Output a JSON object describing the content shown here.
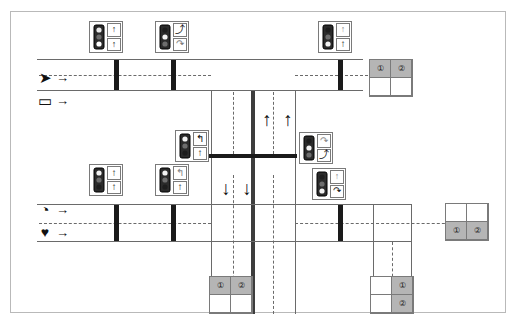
{
  "diagram": {
    "colors": {
      "road_line": "#6a6a6a",
      "stop_bar": "#1a1a1a",
      "median": "#3d3d3d",
      "phase_active_fill": "#b5b5b5",
      "frame_border": "#b9b9b9",
      "background": "#ffffff"
    }
  },
  "legend": {
    "items": [
      {
        "id": "legend-chevron",
        "glyph": "➤",
        "icon": "chevron-detector-icon",
        "arrow": "→"
      },
      {
        "id": "legend-rectangle",
        "glyph": "▭",
        "icon": "rectangle-detector-icon",
        "arrow": "→"
      },
      {
        "id": "legend-pie",
        "glyph": "◔",
        "icon": "pie-detector-icon",
        "arrow": "→"
      },
      {
        "id": "legend-heart",
        "glyph": "♥",
        "icon": "heart-detector-icon",
        "arrow": "→"
      }
    ]
  },
  "signals": [
    {
      "id": "signal-nw-outer",
      "faces": [
        "↑",
        "↑"
      ],
      "face_icons": [
        "through-ball-icon",
        "through-ball-icon"
      ]
    },
    {
      "id": "signal-nw-inner",
      "faces": [
        "⤴",
        "↷"
      ],
      "face_icons": [
        "right-turn-icon",
        "right-turn-curve-icon"
      ]
    },
    {
      "id": "signal-ne-top",
      "faces": [
        "↑",
        "↑"
      ],
      "face_icons": [
        "through-ball-icon",
        "through-arrow-icon"
      ]
    },
    {
      "id": "signal-mid-left",
      "faces": [
        "↰",
        "↑"
      ],
      "face_icons": [
        "left-turn-icon",
        "through-arrow-icon"
      ]
    },
    {
      "id": "signal-mid-right",
      "faces": [
        "↷",
        "⤴"
      ],
      "face_icons": [
        "right-turn-curve-icon",
        "right-turn-icon"
      ]
    },
    {
      "id": "signal-sw-outer",
      "faces": [
        "↑",
        "↑"
      ],
      "face_icons": [
        "through-arrow-icon",
        "through-arrow-icon"
      ]
    },
    {
      "id": "signal-sw-inner",
      "faces": [
        "↰",
        "↑"
      ],
      "face_icons": [
        "left-turn-curve-icon",
        "through-arrow-icon"
      ]
    },
    {
      "id": "signal-se-lower",
      "faces": [
        "↑",
        "↷"
      ],
      "face_icons": [
        "through-ball-icon",
        "right-turn-curve-icon"
      ]
    }
  ],
  "movement_arrows": [
    {
      "id": "arrow-nb-inner",
      "glyph": "↑",
      "direction": "north"
    },
    {
      "id": "arrow-nb-outer",
      "glyph": "↑",
      "direction": "north"
    },
    {
      "id": "arrow-sb-inner",
      "glyph": "↓",
      "direction": "south"
    },
    {
      "id": "arrow-sb-outer",
      "glyph": "↓",
      "direction": "south"
    }
  ],
  "phase_boxes": [
    {
      "id": "phase-box-east-top",
      "layout": "2x2",
      "cells": [
        {
          "label": "①",
          "active": true
        },
        {
          "label": "②",
          "active": true
        },
        {
          "label": "",
          "active": false
        },
        {
          "label": "",
          "active": false
        }
      ]
    },
    {
      "id": "phase-box-east-bottom",
      "layout": "2x2",
      "cells": [
        {
          "label": "",
          "active": false
        },
        {
          "label": "",
          "active": false
        },
        {
          "label": "①",
          "active": true
        },
        {
          "label": "②",
          "active": true
        }
      ]
    },
    {
      "id": "phase-box-south-center",
      "layout": "2x2",
      "cells": [
        {
          "label": "①",
          "active": true
        },
        {
          "label": "②",
          "active": true
        },
        {
          "label": "",
          "active": false
        },
        {
          "label": "",
          "active": false
        }
      ]
    },
    {
      "id": "phase-box-south-right",
      "layout": "2x2",
      "cells": [
        {
          "label": "",
          "active": false
        },
        {
          "label": "①",
          "active": true
        },
        {
          "label": "",
          "active": false
        },
        {
          "label": "②",
          "active": true
        }
      ]
    }
  ]
}
